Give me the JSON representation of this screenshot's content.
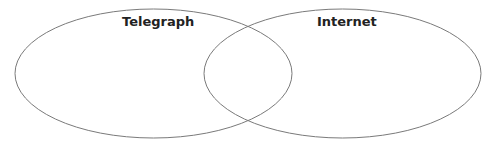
{
  "diagram": {
    "type": "venn",
    "sets": [
      {
        "label": "Telegraph",
        "stroke": "#7a7a7a"
      },
      {
        "label": "Internet",
        "stroke": "#7a7a7a"
      }
    ],
    "intersection_label": ""
  }
}
